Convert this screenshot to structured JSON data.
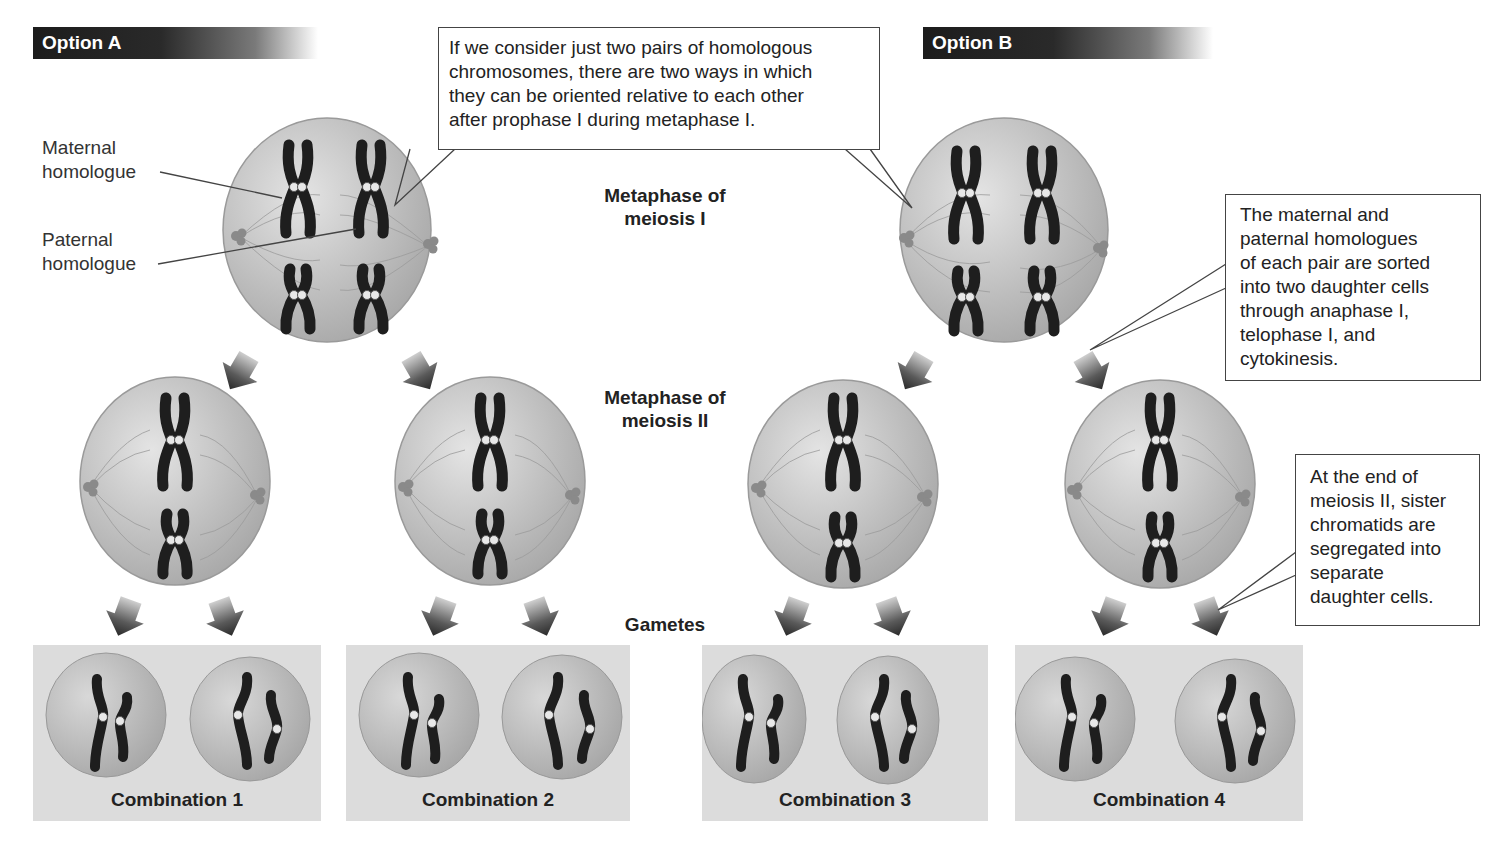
{
  "options": [
    {
      "label": "Option A"
    },
    {
      "label": "Option B"
    }
  ],
  "labels": {
    "maternal": "Maternal homologue",
    "maternal_line1": "Maternal",
    "maternal_line2": "homologue",
    "paternal_line1": "Paternal",
    "paternal_line2": "homologue"
  },
  "stages": {
    "meiosis1_line1": "Metaphase of",
    "meiosis1_line2": "meiosis I",
    "meiosis2_line1": "Metaphase of",
    "meiosis2_line2": "meiosis II",
    "gametes": "Gametes"
  },
  "callouts": {
    "top": [
      "If we consider just two pairs of homologous",
      "chromosomes, there are two ways in which",
      "they can be oriented relative to each other",
      "after prophase I during metaphase I."
    ],
    "sorting": [
      "The maternal and",
      "paternal homologues",
      "of each pair are sorted",
      "into two daughter cells",
      "through anaphase I,",
      "telophase I, and",
      "cytokinesis."
    ],
    "end": [
      "At the end of",
      "meiosis II, sister",
      "chromatids are",
      "segregated into",
      "separate",
      "daughter cells."
    ]
  },
  "combinations": [
    {
      "label": "Combination 1"
    },
    {
      "label": "Combination 2"
    },
    {
      "label": "Combination 3"
    },
    {
      "label": "Combination 4"
    }
  ],
  "colors": {
    "header_bg": "#1c1c1c",
    "cell_fill": "#c8c8c8",
    "chromosome": "#1e1e1e",
    "combo_panel": "#dcdcdc"
  }
}
